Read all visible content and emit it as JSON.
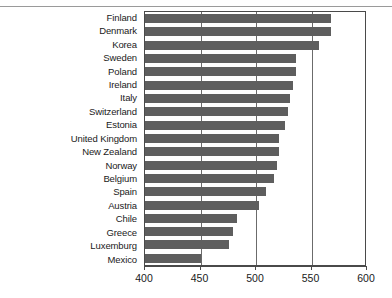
{
  "chart_data": {
    "type": "bar",
    "orientation": "horizontal",
    "title": "",
    "subtitle": "",
    "xlabel": "",
    "ylabel": "",
    "xlim": [
      400,
      600
    ],
    "ylim": null,
    "grid": true,
    "legend": null,
    "legend_position": "none",
    "xticks": [
      400,
      450,
      500,
      550,
      600
    ],
    "xtick_labels": [
      "400",
      "450",
      "500",
      "550",
      "600"
    ],
    "categories": [
      "Finland",
      "Denmark",
      "Korea",
      "Sweden",
      "Poland",
      "Ireland",
      "Italy",
      "Switzerland",
      "Estonia",
      "United Kingdom",
      "New Zealand",
      "Norway",
      "Belgium",
      "Spain",
      "Austria",
      "Chile",
      "Greece",
      "Luxemburg",
      "Mexico"
    ],
    "values": [
      568,
      568,
      557,
      536,
      536,
      533,
      531,
      529,
      526,
      521,
      521,
      519,
      516,
      509,
      503,
      483,
      479,
      476,
      450
    ],
    "bar_color": "#5e5e5e"
  },
  "colors": {
    "bar": "#5e5e5e",
    "axis": "#4a4a4a",
    "gridline": "#6b6b6b",
    "text": "#1a1a1a",
    "background": "#ffffff",
    "top_rule": "#9a9a9a"
  }
}
